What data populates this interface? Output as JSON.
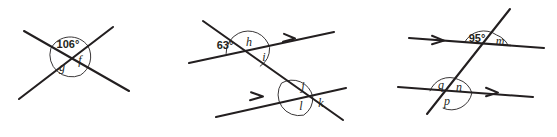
{
  "diagram": {
    "background_color": "#ffffff",
    "line_color": "#231f20",
    "width": 557,
    "height": 137,
    "figures": [
      {
        "id": "figure-1",
        "name": "crossed-lines-106",
        "description": "Two lines crossing at a point forming an X",
        "labels": [
          {
            "key": "value_106",
            "text": "106°",
            "kind": "value"
          },
          {
            "key": "label_f",
            "text": "f",
            "kind": "variable"
          },
          {
            "key": "label_g",
            "text": "g",
            "kind": "variable"
          }
        ],
        "arrow_markers": 0
      },
      {
        "id": "figure-2",
        "name": "transversal-parallel-63",
        "description": "A transversal crossing two parallel lines marked with single arrowheads",
        "labels": [
          {
            "key": "value_63",
            "text": "63°",
            "kind": "value"
          },
          {
            "key": "label_h",
            "text": "h",
            "kind": "variable"
          },
          {
            "key": "label_i",
            "text": "i",
            "kind": "variable"
          },
          {
            "key": "label_j",
            "text": "j",
            "kind": "variable"
          },
          {
            "key": "label_k",
            "text": "k",
            "kind": "variable"
          },
          {
            "key": "label_l",
            "text": "l",
            "kind": "variable"
          }
        ],
        "arrow_markers": 2
      },
      {
        "id": "figure-3",
        "name": "transversal-parallel-95",
        "description": "A transversal crossing two parallel lines marked with single arrowheads",
        "labels": [
          {
            "key": "value_95",
            "text": "95°",
            "kind": "value"
          },
          {
            "key": "label_m",
            "text": "m",
            "kind": "variable"
          },
          {
            "key": "label_n",
            "text": "n",
            "kind": "variable"
          },
          {
            "key": "label_p",
            "text": "p",
            "kind": "variable"
          },
          {
            "key": "label_q",
            "text": "q",
            "kind": "variable"
          }
        ],
        "arrow_markers": 2
      }
    ]
  }
}
